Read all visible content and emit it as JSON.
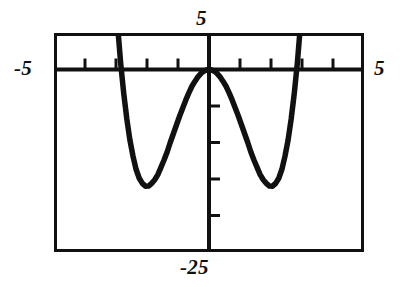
{
  "figure": {
    "kind": "graphing-calculator-plot",
    "background_color": "#ffffff",
    "ink_color": "#111111"
  },
  "labels": {
    "y_max": "5",
    "x_min": "-5",
    "x_max": "5",
    "y_min": "-25"
  },
  "chart_data": {
    "type": "line",
    "title": "",
    "xlabel": "",
    "ylabel": "",
    "xlim": [
      -5,
      5
    ],
    "ylim": [
      -25,
      5
    ],
    "grid": false,
    "legend": null,
    "axis_style": "calculator-window-with-tick-marks",
    "x_tick_step": 1,
    "y_tick_step": 5,
    "x_ticks": [
      -5,
      -4,
      -3,
      -2,
      -1,
      0,
      1,
      2,
      3,
      4,
      5
    ],
    "y_ticks": [
      5,
      0,
      -5,
      -10,
      -15,
      -20,
      -25
    ],
    "annotations": [
      {
        "text": "5",
        "position": "top-of-y-axis"
      },
      {
        "text": "-5",
        "position": "left-of-x-axis"
      },
      {
        "text": "5",
        "position": "right-of-x-axis"
      },
      {
        "text": "-25",
        "position": "bottom-of-y-axis"
      }
    ],
    "series": [
      {
        "name": "quartic",
        "equation": "y = x^4 - 8x^2",
        "local_maximum": {
          "x": 0,
          "y": 0
        },
        "local_minima": [
          {
            "x": -2,
            "y": -16
          },
          {
            "x": 2,
            "y": -16
          }
        ],
        "x_intercepts": [
          -2.83,
          0,
          2.83
        ],
        "x": [
          -3.05,
          -2.95,
          -2.85,
          -2.75,
          -2.65,
          -2.55,
          -2.45,
          -2.35,
          -2.25,
          -2.15,
          -2.05,
          -1.95,
          -1.85,
          -1.75,
          -1.65,
          -1.55,
          -1.45,
          -1.35,
          -1.25,
          -1.15,
          -1.05,
          -0.95,
          -0.85,
          -0.75,
          -0.65,
          -0.55,
          -0.45,
          -0.35,
          -0.25,
          -0.15,
          -0.05,
          0.05,
          0.15,
          0.25,
          0.35,
          0.45,
          0.55,
          0.65,
          0.75,
          0.85,
          0.95,
          1.05,
          1.15,
          1.25,
          1.35,
          1.45,
          1.55,
          1.65,
          1.75,
          1.85,
          1.95,
          2.05,
          2.15,
          2.25,
          2.35,
          2.45,
          2.55,
          2.65,
          2.75,
          2.85,
          2.95,
          3.05
        ],
        "y": [
          12.1,
          6.1,
          0.9,
          -3.3,
          -6.8,
          -9.7,
          -11.9,
          -13.7,
          -14.9,
          -15.6,
          -15.98,
          -15.97,
          -15.6,
          -15.1,
          -14.4,
          -13.4,
          -12.4,
          -11.3,
          -10.0,
          -8.8,
          -7.6,
          -6.4,
          -5.3,
          -4.2,
          -3.2,
          -2.3,
          -1.6,
          -0.97,
          -0.49,
          -0.18,
          -0.02,
          -0.02,
          -0.18,
          -0.49,
          -0.97,
          -1.6,
          -2.3,
          -3.2,
          -4.2,
          -5.3,
          -6.4,
          -7.6,
          -8.8,
          -10.0,
          -11.3,
          -12.4,
          -13.4,
          -14.4,
          -15.1,
          -15.6,
          -15.97,
          -15.98,
          -15.6,
          -14.9,
          -13.7,
          -11.9,
          -9.7,
          -6.8,
          -3.3,
          0.9,
          6.1,
          12.1
        ]
      }
    ]
  }
}
